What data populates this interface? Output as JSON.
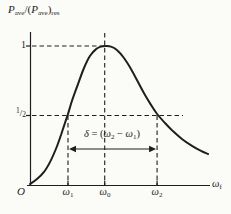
{
  "figure": {
    "ylabel": {
      "P1": "P",
      "sub1": "ave",
      "mid": "/(",
      "P2": "P",
      "sub2": "ave",
      "close": ")",
      "sub3": "res"
    },
    "y_ticks": {
      "one": "1",
      "half_num": "1",
      "half_slash": "/",
      "half_den": "2"
    },
    "origin": "O",
    "x_ticks": [
      {
        "base": "ω",
        "sub": "1"
      },
      {
        "base": "ω",
        "sub": "0"
      },
      {
        "base": "ω",
        "sub": "2"
      }
    ],
    "xlabel": {
      "base": "ω",
      "sub": "f"
    },
    "delta": {
      "d": "δ",
      "eq": " = (",
      "w1": "ω",
      "s1": "2",
      "minus": " − ",
      "w2": "ω",
      "s2": "1",
      "close": ")"
    }
  },
  "chart_data": {
    "type": "line",
    "title": "",
    "ylabel": "P_ave/(P_ave)_res",
    "xlabel": "ω_f",
    "x_tick_labels": [
      "ω_1",
      "ω_0",
      "ω_2"
    ],
    "y_tick_labels": [
      "1",
      "1/2"
    ],
    "y_tick_values": [
      1,
      0.5
    ],
    "ylim": [
      0,
      1
    ],
    "annotation": "δ = (ω_2 − ω_1)",
    "x_tick_fractions": [
      0.211,
      0.415,
      0.706
    ],
    "half_power_value": 0.5,
    "half_power_dash_end_fraction": 0.85,
    "omega0_dash_top_ratio": 1.094,
    "peak_ratio": 1.0,
    "delta_arrow": {
      "from_fraction": 0.211,
      "to_fraction": 0.706,
      "y_ratio": 0.259
    },
    "grid": false,
    "legend": false,
    "series": [
      {
        "name": "P_ave/(P_ave)_res vs ω_f",
        "x": [
          0.0,
          0.039,
          0.078,
          0.111,
          0.144,
          0.172,
          0.2,
          0.211,
          0.233,
          0.267,
          0.3,
          0.333,
          0.367,
          0.394,
          0.422,
          0.45,
          0.483,
          0.522,
          0.561,
          0.6,
          0.639,
          0.672,
          0.706,
          0.75,
          0.794,
          0.844,
          0.9,
          0.95,
          0.989
        ],
        "y": [
          0.007,
          0.043,
          0.094,
          0.165,
          0.259,
          0.36,
          0.468,
          0.511,
          0.604,
          0.727,
          0.842,
          0.928,
          0.978,
          0.996,
          1.0,
          0.996,
          0.971,
          0.914,
          0.835,
          0.741,
          0.647,
          0.576,
          0.511,
          0.446,
          0.388,
          0.331,
          0.281,
          0.245,
          0.223
        ]
      }
    ],
    "colors": {
      "ink": "#1e1e1e",
      "background": "#fbfbf8"
    }
  }
}
